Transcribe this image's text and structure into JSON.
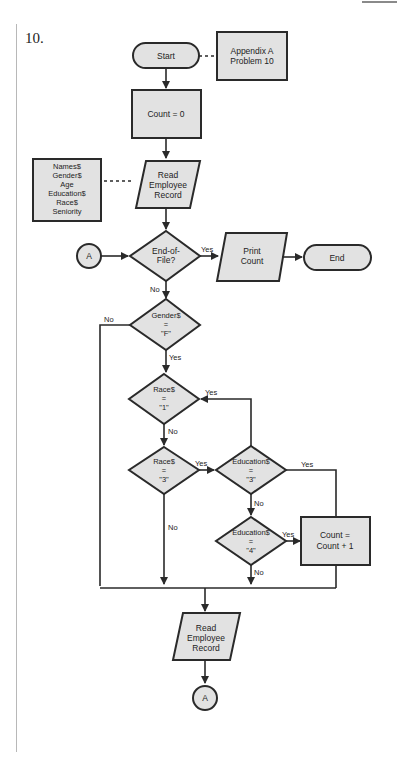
{
  "problem_number": "10.",
  "nodes": {
    "start": "Start",
    "annotation_title_1": "Appendix A",
    "annotation_title_2": "Problem 10",
    "init": "Count = 0",
    "fields": [
      "Names$",
      "Gender$",
      "Age",
      "Education$",
      "Race$",
      "Seniority"
    ],
    "read1": [
      "Read",
      "Employee",
      "Record"
    ],
    "connector_in": "A",
    "eof": [
      "End-of-",
      "File?"
    ],
    "print": [
      "Print",
      "Count"
    ],
    "end": "End",
    "gender": [
      "Gender$",
      "=",
      "\"F\""
    ],
    "race1": [
      "Race$",
      "=",
      "\"1\""
    ],
    "race3": [
      "Race$",
      "=",
      "\"3\""
    ],
    "edu3": [
      "Education$",
      "=",
      "\"3\""
    ],
    "edu4": [
      "Education$",
      "=",
      "\"4\""
    ],
    "increment": [
      "Count =",
      "Count + 1"
    ],
    "read2": [
      "Read",
      "Employee",
      "Record"
    ],
    "connector_out": "A"
  },
  "edges": {
    "yes": "Yes",
    "no": "No"
  }
}
